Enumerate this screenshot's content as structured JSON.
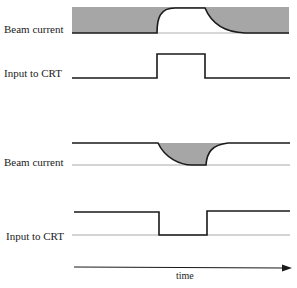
{
  "diagram": {
    "panels": [
      {
        "beam_label": "Beam current",
        "input_label": "Input to CRT",
        "description": "Positive input pulse; beam current rises with delay and decays slowly"
      },
      {
        "beam_label": "Beam current",
        "input_label": "Input to CRT",
        "description": "Negative input pulse; beam current dips and recovers"
      }
    ],
    "axis": {
      "label": "time"
    },
    "colors": {
      "line": "#1a1a1a",
      "fill": "#a6a6a6",
      "baseline": "#aaaaaa"
    }
  }
}
